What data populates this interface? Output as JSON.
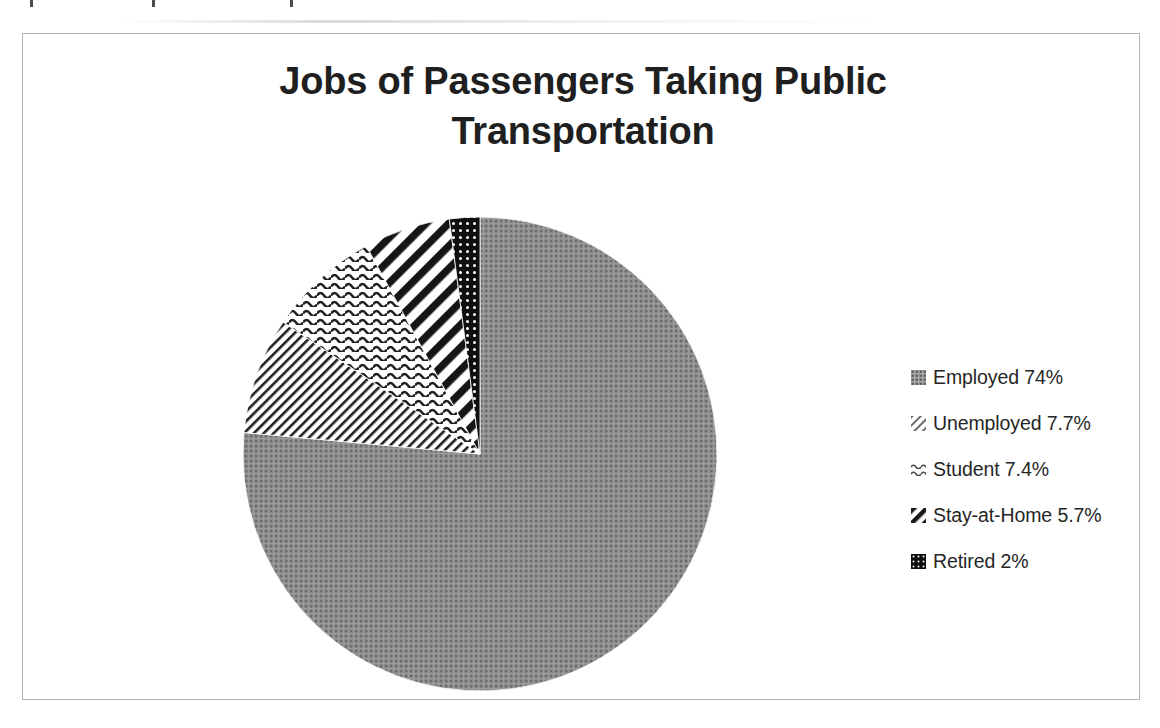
{
  "chart_data": {
    "type": "pie",
    "title": "Jobs of Passengers Taking Public Transportation",
    "title_line_1": "Jobs of Passengers Taking Public",
    "title_line_2": "Transportation",
    "categories": [
      "Employed",
      "Unemployed",
      "Student",
      "Stay-at-Home",
      "Retired"
    ],
    "values": [
      74,
      7.7,
      7.4,
      5.7,
      2
    ],
    "value_labels": [
      "74%",
      "7.7%",
      "7.4%",
      "5.7%",
      "2%"
    ],
    "legend_entries": [
      "Employed 74%",
      "Unemployed 7.7%",
      "Student 7.4%",
      "Stay-at-Home 5.7%",
      "Retired 2%"
    ],
    "slice_patterns": [
      "grey-grid-checker",
      "fine-diagonal-lines",
      "wavy-horizontal-lines",
      "bold-diagonal-stripes",
      "black-with-white-dots"
    ],
    "start_angle_deg": 0,
    "direction": "clockwise",
    "legend_position": "right",
    "grid": false,
    "xlabel": "",
    "ylabel": "",
    "colors": {
      "slice_employed": "#8c8c8c",
      "slice_pattern_ink": "#1a1a1a",
      "slice_retired_fill": "#111111",
      "frame_border": "#b3b3b3",
      "title_text": "#1f1f1f",
      "legend_text": "#262626",
      "background": "#ffffff"
    }
  },
  "legend": {
    "items": [
      {
        "label": "Employed 74%",
        "swatch": "grid-swatch-icon"
      },
      {
        "label": "Unemployed 7.7%",
        "swatch": "diagonal-swatch-icon"
      },
      {
        "label": "Student 7.4%",
        "swatch": "wavy-swatch-icon"
      },
      {
        "label": "Stay-at-Home 5.7%",
        "swatch": "stripe-swatch-icon"
      },
      {
        "label": "Retired 2%",
        "swatch": "dotted-black-swatch-icon"
      }
    ]
  }
}
